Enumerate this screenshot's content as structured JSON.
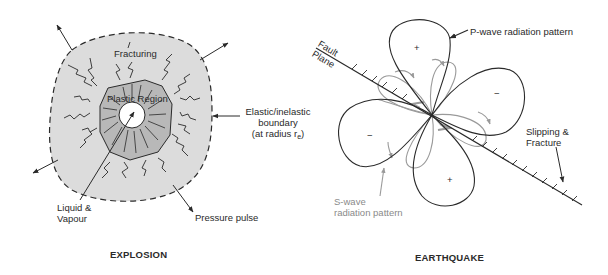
{
  "explosion": {
    "title": "EXPLOSION",
    "labels": {
      "fracturing": "Fracturing",
      "plastic_region": "Plastic Region",
      "boundary_line1": "Elastic/inelastic",
      "boundary_line2": "boundary",
      "boundary_line3_prefix": "(at radius r",
      "boundary_subscript": "e",
      "boundary_line3_suffix": ")",
      "liquid_line1": "Liquid &",
      "liquid_line2": "Vapour",
      "pressure_pulse": "Pressure pulse"
    },
    "colors": {
      "outer_fill": "#dcdcdc",
      "plastic_fill": "#b8b8b8",
      "core_fill": "#ffffff",
      "ink": "#2a2a2a"
    }
  },
  "earthquake": {
    "title": "EARTHQUAKE",
    "labels": {
      "p_wave": "P-wave radiation pattern",
      "fault_line1": "Fault",
      "fault_line2": "Plane",
      "slipping_line1": "Slipping &",
      "slipping_line2": "Fracture",
      "s_wave_line1": "S-wave",
      "s_wave_line2": "radiation pattern"
    },
    "lobe_signs": {
      "top": "+",
      "right": "−",
      "left": "−",
      "bottom": "+"
    },
    "colors": {
      "p_wave": "#2a2a2a",
      "s_wave": "#9a9a9a"
    }
  }
}
